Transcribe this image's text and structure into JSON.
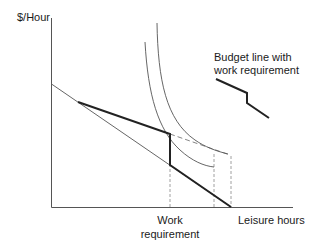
{
  "diagram": {
    "type": "labor-leisure budget constraint diagram",
    "y_axis_label": "$/Hour",
    "x_axis_label": "Leisure hours",
    "x_marker_label_line1": "Work",
    "x_marker_label_line2": "requirement",
    "legend_line1": "Budget line with",
    "legend_line2": "work requirement",
    "elements": [
      {
        "name": "original-budget-line",
        "style": "thin solid"
      },
      {
        "name": "budget-line-with-work-requirement",
        "style": "thick solid",
        "shape": "kinked with vertical drop at work requirement"
      },
      {
        "name": "dashed-budget-extension",
        "style": "dashed"
      },
      {
        "name": "indifference-curve-higher",
        "style": "thin solid curve"
      },
      {
        "name": "indifference-curve-lower",
        "style": "thin solid curve"
      },
      {
        "name": "guide-work-requirement",
        "style": "dashed vertical"
      },
      {
        "name": "guide-lower-optimum",
        "style": "dashed vertical"
      },
      {
        "name": "guide-higher-optimum",
        "style": "dashed vertical"
      }
    ],
    "colors": {
      "axis": "#555555",
      "thin_line": "#666666",
      "thick_line": "#222222",
      "dashed": "#888888",
      "text": "#1a1a1a"
    }
  }
}
